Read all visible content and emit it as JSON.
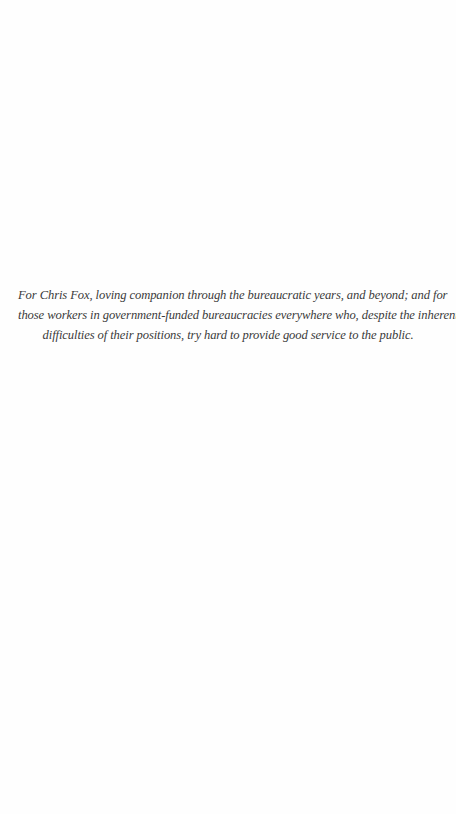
{
  "dedication": {
    "lines": [
      "For Chris Fox, loving companion through the bureaucratic years, and beyond; and for",
      "those workers in government-funded bureaucracies everywhere who, despite the inherent",
      "difficulties of their positions, try hard to provide good service to the public."
    ]
  }
}
